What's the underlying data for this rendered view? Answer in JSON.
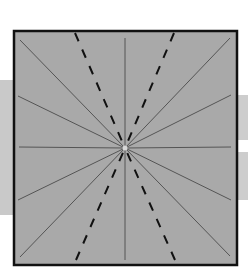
{
  "diagram": {
    "colors": {
      "panel_fill": "#a9a9a9",
      "panel_border": "#111111",
      "radial_line": "#555555",
      "dashed_line": "#111111",
      "background_band": "#c9c9c9"
    },
    "panel": {
      "x": 14,
      "y": 31,
      "width": 223,
      "height": 234
    },
    "center": {
      "x": 125,
      "y": 148
    },
    "radial_lines": [
      {
        "x": 20,
        "y": 40
      },
      {
        "x": 18,
        "y": 96
      },
      {
        "x": 19,
        "y": 147
      },
      {
        "x": 18,
        "y": 200
      },
      {
        "x": 20,
        "y": 257
      },
      {
        "x": 230,
        "y": 38
      },
      {
        "x": 231,
        "y": 95
      },
      {
        "x": 231,
        "y": 147
      },
      {
        "x": 231,
        "y": 200
      },
      {
        "x": 230,
        "y": 256
      },
      {
        "x": 125,
        "y": 38
      },
      {
        "x": 125,
        "y": 260
      }
    ],
    "dashed_lines": [
      {
        "x": 75,
        "y": 33
      },
      {
        "x": 174,
        "y": 33
      },
      {
        "x": 76,
        "y": 260
      },
      {
        "x": 175,
        "y": 260
      }
    ]
  }
}
